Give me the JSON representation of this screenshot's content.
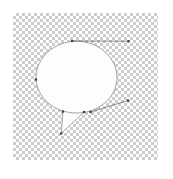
{
  "app": {
    "surface": "vector-canvas",
    "title": "",
    "zoom": ""
  },
  "canvas": {
    "name": "transparency-checkerboard",
    "x": 13,
    "y": 13,
    "width": 145,
    "height": 147,
    "checker_light": "#ffffff",
    "checker_dark": "#cdcdcd",
    "checker_cell_px": 3,
    "background": "#ffffff"
  },
  "artwork": {
    "name": "speech-bubble",
    "fill_color": "#fdfdfd",
    "stroke_color": "#8f8f8f",
    "stroke_width": 0.8,
    "selected": true,
    "bubble_path": "M 76.5 41.2 C 54.5 41.2 36.0 57.5 36.0 77.5 C 36.0 97.5 54.5 113.0 76.5 113.0 C 98.5 113.0 117.0 97.5 117.0 77.5 C 117.0 57.5 98.5 41.2 76.5 41.2 Z",
    "tail_path": "M 63.0 111.5 L 61.2 133.5 L 84.0 112.2"
  },
  "path_editing": {
    "name": "bezier-overlay",
    "node_color": "#3a3a3a",
    "handle_color": "#4a4a4a",
    "anchors": [
      {
        "label": "anchor-top",
        "x": 72.0,
        "y": 41.0
      },
      {
        "label": "anchor-left",
        "x": 36.0,
        "y": 79.5
      },
      {
        "label": "anchor-tail-left",
        "x": 63.0,
        "y": 111.5
      },
      {
        "label": "anchor-tail-tip",
        "x": 61.2,
        "y": 133.5
      },
      {
        "label": "anchor-tail-right",
        "x": 84.0,
        "y": 112.0
      },
      {
        "label": "anchor-bottom-right",
        "x": 90.5,
        "y": 112.0
      }
    ],
    "handles": [
      {
        "label": "handle-top-right",
        "from_x": 72.0,
        "from_y": 41.0,
        "to_x": 128.5,
        "to_y": 41.2
      },
      {
        "label": "handle-bottom-right",
        "from_x": 90.5,
        "from_y": 112.0,
        "to_x": 128.0,
        "to_y": 100.5
      }
    ]
  }
}
